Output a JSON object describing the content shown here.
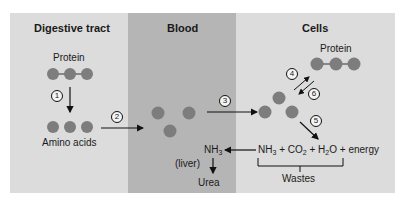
{
  "columns": {
    "digestive": {
      "title": "Digestive tract",
      "protein_label": "Protein",
      "amino_label": "Amino acids"
    },
    "blood": {
      "title": "Blood",
      "ammonia": "NH",
      "ammonia_sub": "3",
      "liver_label": "(liver)",
      "urea_label": "Urea"
    },
    "cells": {
      "title": "Cells",
      "protein_label": "Protein",
      "products": {
        "nh": "NH",
        "nh_sub": "3",
        "plus1": " + CO",
        "co_sub": "2",
        "plus2": " + H",
        "h_sub": "2",
        "o": "O",
        "energy": " + energy"
      },
      "wastes_label": "Wastes"
    }
  },
  "steps": [
    "1",
    "2",
    "3",
    "4",
    "5",
    "6"
  ],
  "colors": {
    "panel": "#dcdcdc",
    "blood_band": "#b5b5b5",
    "molecule": "#7d7d7d",
    "arrow": "#111111"
  }
}
